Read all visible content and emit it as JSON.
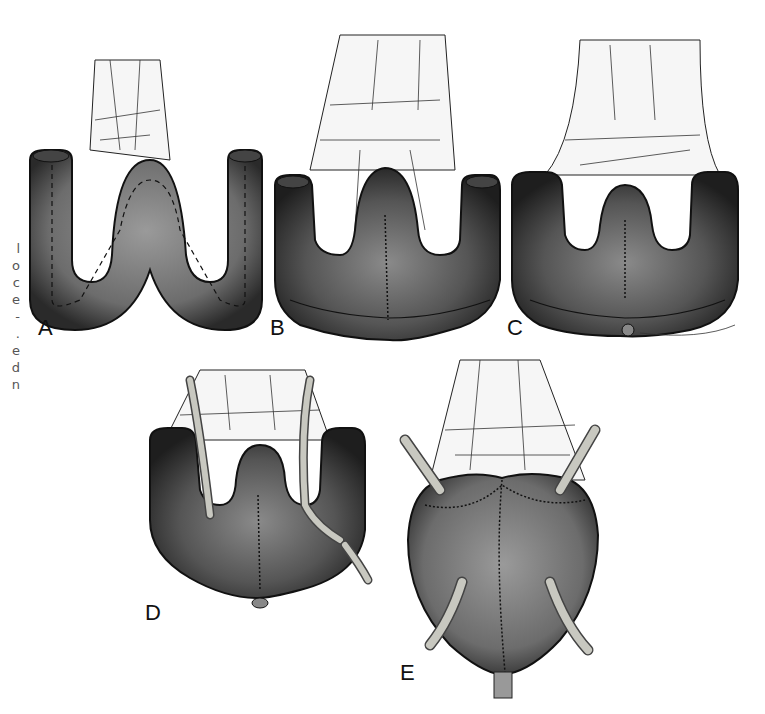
{
  "figure": {
    "caption_fragment_chars": [
      "l",
      "o",
      "c",
      "e",
      "-",
      ".",
      "e",
      "d",
      "n"
    ],
    "panels": [
      {
        "label": "A",
        "description": "bowel segment folded into W configuration with dashed incision line"
      },
      {
        "label": "B",
        "description": "opened W segment, posterior wall sutured midline"
      },
      {
        "label": "C",
        "description": "opened segment with ureters/inner walls, lower suture"
      },
      {
        "label": "D",
        "description": "ureteral stents placed through opened reservoir"
      },
      {
        "label": "E",
        "description": "closed pouch with suture lines and two stents exiting"
      }
    ],
    "colors": {
      "tissue": "#7a7a7a",
      "tissue_dark": "#2a2a2a",
      "mesentery": "#f4f4f4",
      "vessel": "#333333",
      "stent": "#c8c8c0"
    }
  }
}
